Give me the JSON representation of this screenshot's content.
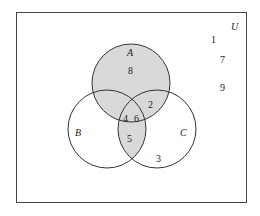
{
  "diagram": {
    "type": "venn",
    "universe_label": "U",
    "sets": [
      {
        "label": "A"
      },
      {
        "label": "B"
      },
      {
        "label": "C"
      }
    ],
    "shaded_region": "A ∪ (B ∩ C)",
    "elements": {
      "outside": [
        "1",
        "7",
        "9"
      ],
      "A_only": "8",
      "A_and_C_only": "2",
      "A_and_B_only": "",
      "A_B_C": [
        "4",
        "6"
      ],
      "B_and_C_only": "5",
      "C_only": "3",
      "B_only": ""
    },
    "colors": {
      "shade": "#d9d9d9",
      "stroke": "#333333"
    }
  }
}
